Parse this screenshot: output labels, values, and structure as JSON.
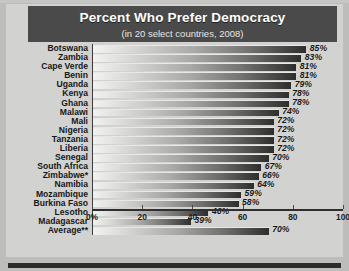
{
  "chart_data": {
    "type": "bar",
    "orientation": "horizontal",
    "title": "Percent Who Prefer Democracy",
    "subtitle": "(in 20 select countries, 2008)",
    "xlabel": "",
    "ylabel": "",
    "xlim": [
      0,
      100
    ],
    "grid": false,
    "legend": "none",
    "tick_labels": [
      "0%",
      "20",
      "40",
      "60",
      "80",
      "100"
    ],
    "ticks": [
      0,
      20,
      40,
      60,
      80,
      100
    ],
    "categories": [
      "Botswana",
      "Zambia",
      "Cape Verde",
      "Benin",
      "Uganda",
      "Kenya",
      "Ghana",
      "Malawi",
      "Mali",
      "Nigeria",
      "Tanzania",
      "Liberia",
      "Senegal",
      "South Africa",
      "Zimbabwe*",
      "Namibia",
      "Mozambique",
      "Burkina Faso",
      "Lesotho",
      "Madagascar",
      "Average**"
    ],
    "values": [
      85,
      83,
      81,
      81,
      79,
      78,
      78,
      74,
      72,
      72,
      72,
      72,
      70,
      67,
      66,
      64,
      59,
      58,
      46,
      39,
      70
    ],
    "value_labels": [
      "85%",
      "83%",
      "81%",
      "81%",
      "79%",
      "78%",
      "78%",
      "74%",
      "72%",
      "72%",
      "72%",
      "72%",
      "70%",
      "67%",
      "66%",
      "64%",
      "59%",
      "58%",
      "46%",
      "39%",
      "70%"
    ],
    "bar_gradient_start": "#f2f2f0",
    "bar_gradient_end": "#2e2e2e",
    "title_bar_color": "#4a4a4a",
    "title_text_color": "#ffffff",
    "plot_background": "#d2d2d0"
  }
}
